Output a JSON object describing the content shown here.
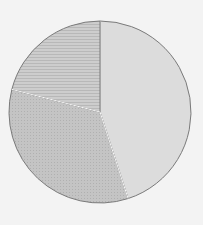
{
  "chart_data": {
    "type": "pie",
    "title": "",
    "labels": [
      "Slice A",
      "Slice B",
      "Slice C"
    ],
    "values": [
      45,
      34,
      21
    ],
    "start_angle_deg": 0,
    "direction": "clockwise",
    "colors": [
      "#d9d9d9",
      "#bdbdbd",
      "#c9c9c9"
    ],
    "edge_color": "#7a7a7a",
    "legend": false,
    "data_labels": false
  }
}
